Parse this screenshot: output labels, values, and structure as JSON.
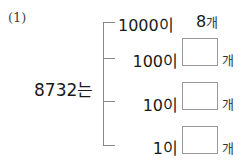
{
  "problem": {
    "number": "(1)",
    "number_value": "8732는",
    "rows": [
      {
        "place": "1000이",
        "answer": "8",
        "unit": "개",
        "filled": true
      },
      {
        "place": "100이",
        "answer": "",
        "unit": "개",
        "filled": false
      },
      {
        "place": "10이",
        "answer": "",
        "unit": "개",
        "filled": false
      },
      {
        "place": "1이",
        "answer": "",
        "unit": "개",
        "filled": false
      }
    ]
  }
}
